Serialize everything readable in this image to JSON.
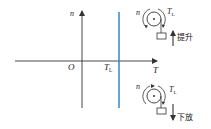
{
  "diagram": {
    "type": "torque-speed characteristic (potential load)",
    "axes": {
      "x_label": "T",
      "y_label": "n",
      "origin_label": "O"
    },
    "load_line": {
      "label_main": "T",
      "label_sub": "L",
      "color": "#3b8fd1"
    },
    "top_pulley": {
      "speed_label": "n",
      "torque_label_main": "T",
      "torque_label_sub": "L",
      "motion_label": "提升",
      "direction": "up"
    },
    "bottom_pulley": {
      "speed_label": "n",
      "torque_label_main": "T",
      "torque_label_sub": "L",
      "motion_label": "下放",
      "direction": "down"
    },
    "colors": {
      "axis": "#333333",
      "load_line": "#3b8fd1"
    }
  }
}
